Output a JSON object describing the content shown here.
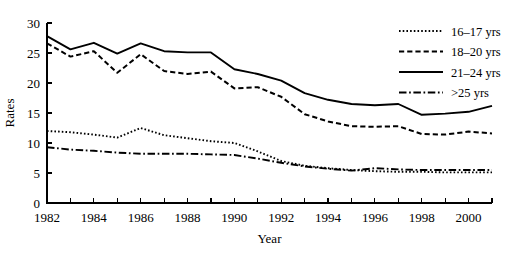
{
  "chart_data": {
    "type": "line",
    "title": "",
    "xlabel": "Year",
    "ylabel": "Rates",
    "grid": false,
    "legend_position": "top-right",
    "xlim": [
      1982,
      2001
    ],
    "ylim": [
      0,
      30
    ],
    "x": [
      1982,
      1983,
      1984,
      1985,
      1986,
      1987,
      1988,
      1989,
      1990,
      1991,
      1992,
      1993,
      1994,
      1995,
      1996,
      1997,
      1998,
      1999,
      2000,
      2001
    ],
    "xticks": [
      1982,
      1984,
      1986,
      1988,
      1990,
      1992,
      1994,
      1996,
      1998,
      2000
    ],
    "xtick_labels": [
      "1982",
      "1984",
      "1986",
      "1988",
      "1990",
      "1992",
      "1994",
      "1996",
      "1998",
      "2000"
    ],
    "yticks": [
      0,
      5,
      10,
      15,
      20,
      25,
      30
    ],
    "ytick_labels": [
      "0",
      "5",
      "10",
      "15",
      "20",
      "25",
      "30"
    ],
    "series": [
      {
        "name": "16–17 yrs",
        "style": "dotted",
        "values": [
          12.0,
          11.8,
          11.4,
          10.9,
          12.5,
          11.3,
          10.8,
          10.3,
          10.0,
          8.6,
          7.0,
          6.2,
          5.8,
          5.5,
          5.3,
          5.2,
          5.2,
          5.1,
          5.1,
          5.1
        ]
      },
      {
        "name": "18–20 yrs",
        "style": "dashed",
        "values": [
          26.6,
          24.4,
          25.3,
          21.7,
          24.8,
          22.0,
          21.5,
          21.9,
          19.1,
          19.3,
          17.7,
          14.8,
          13.6,
          12.8,
          12.7,
          12.8,
          11.5,
          11.4,
          11.9,
          11.6
        ]
      },
      {
        "name": "21–24 yrs",
        "style": "solid",
        "values": [
          27.8,
          25.6,
          26.7,
          24.9,
          26.6,
          25.3,
          25.1,
          25.1,
          22.3,
          21.5,
          20.4,
          18.3,
          17.2,
          16.5,
          16.3,
          16.5,
          14.7,
          14.9,
          15.2,
          16.2
        ]
      },
      {
        "name": ">25 yrs",
        "style": "dashdot",
        "values": [
          9.3,
          8.9,
          8.7,
          8.4,
          8.2,
          8.2,
          8.2,
          8.1,
          8.0,
          7.4,
          6.7,
          6.1,
          5.7,
          5.4,
          5.8,
          5.6,
          5.5,
          5.5,
          5.5,
          5.5
        ]
      }
    ]
  }
}
